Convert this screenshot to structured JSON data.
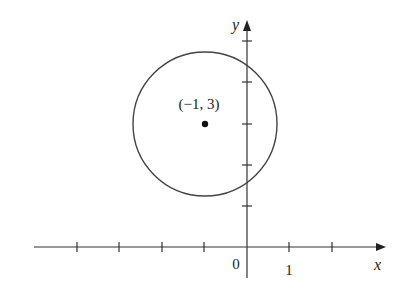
{
  "figure": {
    "type": "coordinate-plane-circle",
    "x_axis_label": "x",
    "y_axis_label": "y",
    "origin_label": "0",
    "x_unit_label": "1",
    "center_label": "(−1, 3)",
    "center": {
      "x": -1,
      "y": 3
    },
    "radius_units": 1.7,
    "x_ticks": [
      -4,
      -3,
      -2,
      -1,
      1,
      2
    ],
    "y_ticks": [
      1,
      2,
      3,
      4,
      5
    ],
    "colors": {
      "stroke": "#333333",
      "point": "#111111",
      "text": "#222222"
    }
  }
}
